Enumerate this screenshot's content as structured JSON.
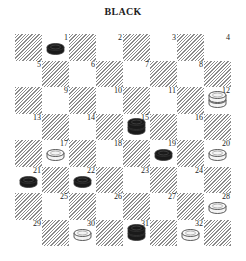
{
  "title": "BLACK",
  "board": {
    "rows": 8,
    "cols": 8,
    "colors": {
      "hatch": "#8a8a8a",
      "light": "#ffffff",
      "black_piece": "#1a1a1a",
      "white_piece": "#f4f4f4",
      "outline": "#333333"
    },
    "squares": [
      {
        "n": "1",
        "row": 0,
        "col": 1
      },
      {
        "n": "2",
        "row": 0,
        "col": 3
      },
      {
        "n": "3",
        "row": 0,
        "col": 5
      },
      {
        "n": "4",
        "row": 0,
        "col": 7
      },
      {
        "n": "5",
        "row": 1,
        "col": 0
      },
      {
        "n": "6",
        "row": 1,
        "col": 2
      },
      {
        "n": "7",
        "row": 1,
        "col": 4
      },
      {
        "n": "8",
        "row": 1,
        "col": 6
      },
      {
        "n": "9",
        "row": 2,
        "col": 1
      },
      {
        "n": "10",
        "row": 2,
        "col": 3
      },
      {
        "n": "11",
        "row": 2,
        "col": 5
      },
      {
        "n": "12",
        "row": 2,
        "col": 7
      },
      {
        "n": "13",
        "row": 3,
        "col": 0
      },
      {
        "n": "14",
        "row": 3,
        "col": 2
      },
      {
        "n": "15",
        "row": 3,
        "col": 4
      },
      {
        "n": "16",
        "row": 3,
        "col": 6
      },
      {
        "n": "17",
        "row": 4,
        "col": 1
      },
      {
        "n": "18",
        "row": 4,
        "col": 3
      },
      {
        "n": "19",
        "row": 4,
        "col": 5
      },
      {
        "n": "20",
        "row": 4,
        "col": 7
      },
      {
        "n": "21",
        "row": 5,
        "col": 0
      },
      {
        "n": "22",
        "row": 5,
        "col": 2
      },
      {
        "n": "23",
        "row": 5,
        "col": 4
      },
      {
        "n": "24",
        "row": 5,
        "col": 6
      },
      {
        "n": "25",
        "row": 6,
        "col": 1
      },
      {
        "n": "26",
        "row": 6,
        "col": 3
      },
      {
        "n": "27",
        "row": 6,
        "col": 5
      },
      {
        "n": "28",
        "row": 6,
        "col": 7
      },
      {
        "n": "29",
        "row": 7,
        "col": 0
      },
      {
        "n": "30",
        "row": 7,
        "col": 2
      },
      {
        "n": "31",
        "row": 7,
        "col": 4
      },
      {
        "n": "32",
        "row": 7,
        "col": 6
      }
    ],
    "pieces": [
      {
        "square": "1",
        "color": "black",
        "type": "man"
      },
      {
        "square": "12",
        "color": "white",
        "type": "king"
      },
      {
        "square": "15",
        "color": "black",
        "type": "king"
      },
      {
        "square": "17",
        "color": "white",
        "type": "man"
      },
      {
        "square": "19",
        "color": "black",
        "type": "man"
      },
      {
        "square": "20",
        "color": "white",
        "type": "man"
      },
      {
        "square": "21",
        "color": "black",
        "type": "man"
      },
      {
        "square": "22",
        "color": "black",
        "type": "man"
      },
      {
        "square": "28",
        "color": "white",
        "type": "man"
      },
      {
        "square": "30",
        "color": "white",
        "type": "man"
      },
      {
        "square": "31",
        "color": "black",
        "type": "king"
      },
      {
        "square": "32",
        "color": "white",
        "type": "man"
      }
    ]
  }
}
